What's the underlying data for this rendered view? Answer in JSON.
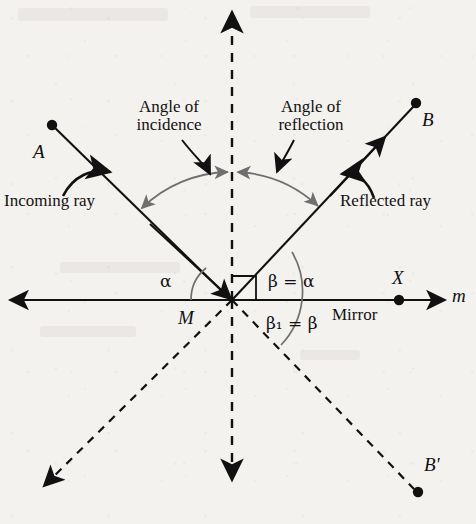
{
  "figure": {
    "title_semantic": "law-of-reflection-diagram",
    "background_color": "#f4f2ef",
    "ink_color": "#111111",
    "arc_color": "#6f6f6f"
  },
  "labels": {
    "angle_of_incidence": "Angle of\nincidence",
    "angle_of_reflection": "Angle of\nreflection",
    "incoming_ray": "Incoming ray",
    "reflected_ray": "Reflected ray",
    "mirror": "Mirror",
    "point_a": "A",
    "point_b": "B",
    "point_b_prime": "B'",
    "point_m": "M",
    "point_x": "X",
    "line_m": "m",
    "alpha": "α",
    "beta_eq_alpha": "β = α",
    "beta1_eq_beta": "β₁ = β"
  },
  "geometry": {
    "vertex_m": {
      "x": 232,
      "y": 300
    },
    "point_a": {
      "x": 52,
      "y": 125
    },
    "point_b": {
      "x": 416,
      "y": 103
    },
    "point_b_prime": {
      "x": 418,
      "y": 492
    },
    "point_x": {
      "x": 399,
      "y": 300
    },
    "mirror_line_y": 300,
    "mirror_left_end": {
      "x": 8,
      "y": 300
    },
    "mirror_right_end": {
      "x": 445,
      "y": 300
    },
    "normal_top": {
      "x": 232,
      "y": 8
    },
    "normal_bottom": {
      "x": 232,
      "y": 486
    },
    "virtual_left_end": {
      "x": 36,
      "y": 492
    }
  },
  "annotations": {
    "incidence_equals_reflection": true,
    "normal_is_dashed": true,
    "virtual_rays_dashed": true
  }
}
